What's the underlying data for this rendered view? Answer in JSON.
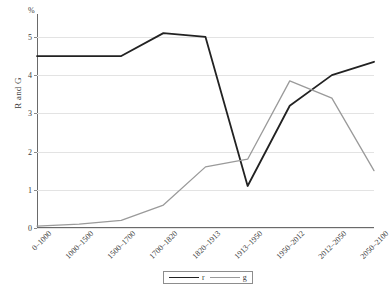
{
  "chart_data": {
    "type": "line",
    "title": "",
    "xlabel": "",
    "ylabel": "R and G",
    "unit_label": "%",
    "categories": [
      "0–1000",
      "1000–1500",
      "1500–1700",
      "1700–1820",
      "1820–1913",
      "1913–1950",
      "1950–2012",
      "2012–2050",
      "2050–2100"
    ],
    "ylim": [
      0,
      5.6
    ],
    "yticks": [
      "0",
      "1",
      "2",
      "3",
      "4",
      "5"
    ],
    "grid": true,
    "legend_position": "bottom",
    "series": [
      {
        "name": "r",
        "color": "#222222",
        "values": [
          4.5,
          4.5,
          4.5,
          5.1,
          5.0,
          1.1,
          3.2,
          4.0,
          4.35
        ]
      },
      {
        "name": "g",
        "color": "#9a9a9a",
        "values": [
          0.05,
          0.1,
          0.2,
          0.6,
          1.6,
          1.8,
          3.85,
          3.4,
          1.5
        ]
      }
    ]
  },
  "legend": {
    "items": [
      {
        "label": "r"
      },
      {
        "label": "g"
      }
    ]
  }
}
